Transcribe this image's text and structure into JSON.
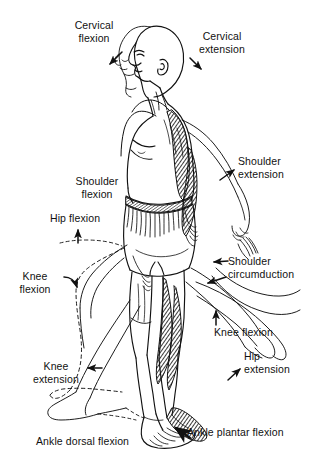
{
  "figure": {
    "background_color": "#ffffff",
    "ink_color": "#111111",
    "width": 310,
    "height": 473
  },
  "labels": [
    {
      "id": "cervical-flexion",
      "text": "Cervical\nflexion",
      "x": 60,
      "y": 19,
      "w": 68,
      "align": "c",
      "arrow": "down-left"
    },
    {
      "id": "cervical-extension",
      "text": "Cervical\nextension",
      "x": 186,
      "y": 30,
      "w": 72,
      "align": "c",
      "arrow": "down-right"
    },
    {
      "id": "shoulder-flexion",
      "text": "Shoulder\nflexion",
      "x": 68,
      "y": 175,
      "w": 58,
      "align": "c",
      "arrow": "none"
    },
    {
      "id": "shoulder-extension",
      "text": "Shoulder\nextension",
      "x": 238,
      "y": 155,
      "w": 66,
      "align": "l",
      "arrow": "up-right"
    },
    {
      "id": "hip-flexion",
      "text": "Hip flexion",
      "x": 50,
      "y": 212,
      "w": 66,
      "align": "l",
      "arrow": "up"
    },
    {
      "id": "knee-flexion-left",
      "text": "Knee\nflexion",
      "x": 12,
      "y": 270,
      "w": 46,
      "align": "c",
      "arrow": "curved-down"
    },
    {
      "id": "shoulder-circumduction",
      "text": "Shoulder\ncircumduction",
      "x": 228,
      "y": 255,
      "w": 82,
      "align": "l",
      "arrow": "left"
    },
    {
      "id": "knee-flexion-right",
      "text": "Knee flexion",
      "x": 214,
      "y": 326,
      "w": 74,
      "align": "l",
      "arrow": "up"
    },
    {
      "id": "hip-extension",
      "text": "Hip\nextension",
      "x": 244,
      "y": 350,
      "w": 62,
      "align": "l",
      "arrow": "up-right"
    },
    {
      "id": "knee-extension",
      "text": "Knee\nextension",
      "x": 24,
      "y": 360,
      "w": 64,
      "align": "c",
      "arrow": "left"
    },
    {
      "id": "ankle-dorsal-flexion",
      "text": "Ankle dorsal flexion",
      "x": 36,
      "y": 435,
      "w": 104,
      "align": "l",
      "arrow": "none"
    },
    {
      "id": "ankle-plantar-flexion",
      "text": "Ankle plantar flexion",
      "x": 187,
      "y": 426,
      "w": 108,
      "align": "l",
      "arrow": "up-left-thick"
    }
  ],
  "movements": [
    "Cervical flexion",
    "Cervical extension",
    "Shoulder flexion",
    "Shoulder extension",
    "Shoulder circumduction",
    "Hip flexion",
    "Hip extension",
    "Knee flexion",
    "Knee extension",
    "Ankle dorsal flexion",
    "Ankle plantar flexion"
  ]
}
